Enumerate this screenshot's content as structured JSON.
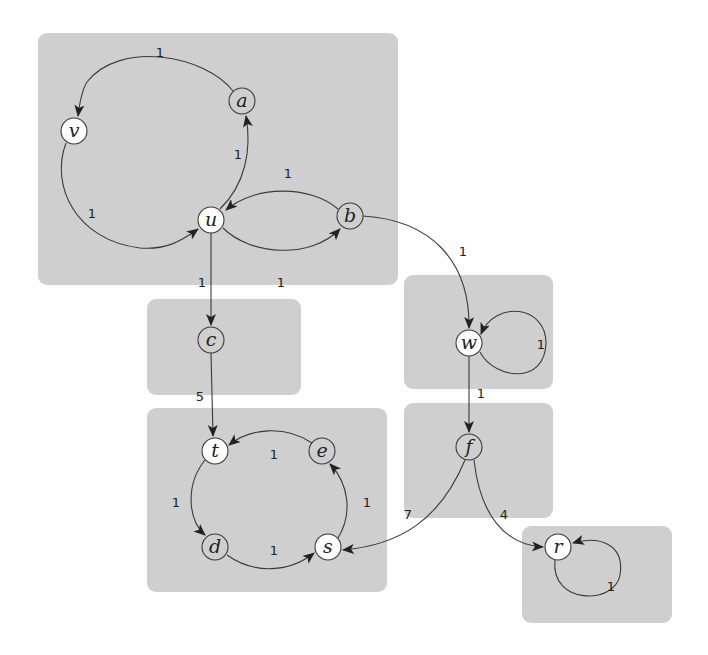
{
  "diagram": {
    "type": "directed-weighted-graph",
    "colors": {
      "background": "#ffffff",
      "component_box": "#cfcfcf",
      "node_white": "#ffffff",
      "node_gray": "#cfcfcf",
      "edge": "#3a3a3a"
    },
    "components": [
      {
        "id": "C1",
        "nodes": [
          "a",
          "v",
          "u",
          "b"
        ],
        "box": [
          38,
          33,
          360,
          252
        ]
      },
      {
        "id": "C2",
        "nodes": [
          "c"
        ],
        "box": [
          147,
          299,
          154,
          96
        ]
      },
      {
        "id": "C3",
        "nodes": [
          "t",
          "e",
          "d",
          "s"
        ],
        "box": [
          147,
          408,
          240,
          184
        ]
      },
      {
        "id": "C4",
        "nodes": [
          "w"
        ],
        "box": [
          404,
          275,
          149,
          114
        ]
      },
      {
        "id": "C5",
        "nodes": [
          "f"
        ],
        "box": [
          404,
          403,
          149,
          115
        ]
      },
      {
        "id": "C6",
        "nodes": [
          "r"
        ],
        "box": [
          522,
          526,
          150,
          97
        ]
      }
    ],
    "nodes": [
      {
        "id": "a",
        "label": "a",
        "x": 242,
        "y": 101,
        "fill": "gray"
      },
      {
        "id": "v",
        "label": "v",
        "x": 74,
        "y": 131,
        "fill": "white"
      },
      {
        "id": "u",
        "label": "u",
        "x": 211,
        "y": 220,
        "fill": "white"
      },
      {
        "id": "b",
        "label": "b",
        "x": 350,
        "y": 216,
        "fill": "gray"
      },
      {
        "id": "c",
        "label": "c",
        "x": 211,
        "y": 340,
        "fill": "gray"
      },
      {
        "id": "t",
        "label": "t",
        "x": 215,
        "y": 451,
        "fill": "white"
      },
      {
        "id": "e",
        "label": "e",
        "x": 322,
        "y": 451,
        "fill": "gray"
      },
      {
        "id": "d",
        "label": "d",
        "x": 215,
        "y": 547,
        "fill": "gray"
      },
      {
        "id": "s",
        "label": "s",
        "x": 328,
        "y": 547,
        "fill": "white"
      },
      {
        "id": "w",
        "label": "w",
        "x": 469,
        "y": 343,
        "fill": "white"
      },
      {
        "id": "f",
        "label": "f",
        "x": 469,
        "y": 447,
        "fill": "gray"
      },
      {
        "id": "r",
        "label": "r",
        "x": 558,
        "y": 547,
        "fill": "white"
      }
    ],
    "edges": [
      {
        "from": "a",
        "to": "v",
        "weight": "1"
      },
      {
        "from": "v",
        "to": "u",
        "weight": "1"
      },
      {
        "from": "u",
        "to": "a",
        "weight": "1"
      },
      {
        "from": "b",
        "to": "u",
        "weight": "1"
      },
      {
        "from": "u",
        "to": "b",
        "weight": "1"
      },
      {
        "from": "u",
        "to": "c",
        "weight": "1"
      },
      {
        "from": "b",
        "to": "w",
        "weight": "1"
      },
      {
        "from": "c",
        "to": "t",
        "weight": "5"
      },
      {
        "from": "e",
        "to": "t",
        "weight": "1"
      },
      {
        "from": "t",
        "to": "d",
        "weight": "1"
      },
      {
        "from": "d",
        "to": "s",
        "weight": "1"
      },
      {
        "from": "s",
        "to": "e",
        "weight": "1"
      },
      {
        "from": "w",
        "to": "w",
        "weight": "1"
      },
      {
        "from": "w",
        "to": "f",
        "weight": "1"
      },
      {
        "from": "f",
        "to": "s",
        "weight": "7"
      },
      {
        "from": "f",
        "to": "r",
        "weight": "4"
      },
      {
        "from": "r",
        "to": "r",
        "weight": "1"
      }
    ]
  }
}
